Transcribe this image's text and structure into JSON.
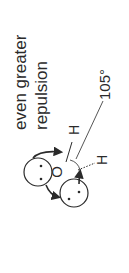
{
  "diagram": {
    "caption_line1": "even greater",
    "caption_line2": "repulsion",
    "central_atom": "O",
    "atom_h1": "H",
    "atom_h2": "H",
    "bond_angle": "105°",
    "lone_pairs": 2,
    "colors": {
      "ink": "#2a2a2a",
      "background": "#ffffff"
    }
  }
}
